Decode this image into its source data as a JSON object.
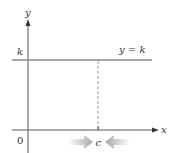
{
  "diagram": {
    "axes": {
      "x_label": "x",
      "y_label": "y",
      "origin_label": "0"
    },
    "horizontal_line": {
      "label": "y = k",
      "y_tick_label": "k"
    },
    "point": {
      "label": "c"
    },
    "colors": {
      "axis": "#555555",
      "line": "#8a8a8a",
      "dashed": "#999999",
      "arrows": "#b5b5b5",
      "text": "#333333"
    }
  }
}
